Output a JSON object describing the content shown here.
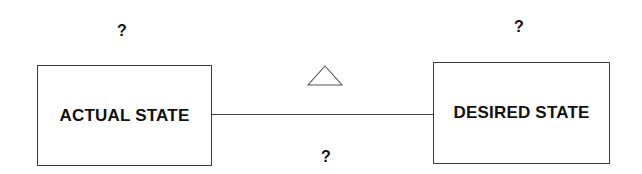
{
  "diagram": {
    "type": "gap-analysis",
    "nodes": [
      {
        "id": "actual",
        "label": "ACTUAL STATE",
        "annotation": "?"
      },
      {
        "id": "desired",
        "label": "DESIRED STATE",
        "annotation": "?"
      }
    ],
    "edge": {
      "from": "actual",
      "to": "desired",
      "symbol": "delta-triangle",
      "symbol_glyph": "△",
      "annotation": "?"
    },
    "colors": {
      "stroke": "#3a3a3a",
      "text": "#111111",
      "background": "#ffffff"
    }
  }
}
